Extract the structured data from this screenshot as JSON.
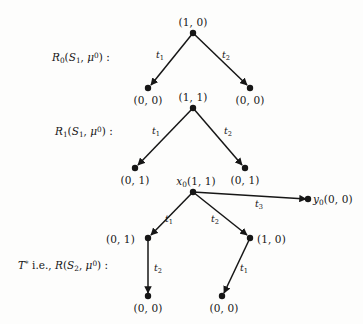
{
  "figure": {
    "background_color": "#fdfdfc",
    "ink_color": "#161616",
    "width": 363,
    "height": 324
  },
  "trees": [
    {
      "id": "tree-0",
      "row_label": {
        "name": "R",
        "name_sub": "0",
        "arg1": "S",
        "arg1_sub": "1",
        "arg2": "μ",
        "arg2_sup": "0",
        "colon": ":",
        "full_text": "R₀(S₁, μ⁰) :"
      },
      "root": {
        "id": "t0-root",
        "label": "(1, 0)",
        "x": 193,
        "y": 33
      },
      "children": [
        {
          "id": "t0-left",
          "label": "(0, 0)",
          "x": 148,
          "y": 88,
          "edge_label": "t",
          "edge_label_sub": "1"
        },
        {
          "id": "t0-right",
          "label": "(0, 0)",
          "x": 250,
          "y": 88,
          "edge_label": "t",
          "edge_label_sub": "2"
        }
      ]
    },
    {
      "id": "tree-1",
      "row_label": {
        "name": "R",
        "name_sub": "1",
        "arg1": "S",
        "arg1_sub": "1",
        "arg2": "μ",
        "arg2_sup": "0",
        "colon": ":",
        "full_text": "R₁(S₁, μ⁰) :"
      },
      "root": {
        "id": "t1-root",
        "label": "(1, 1)",
        "x": 193,
        "y": 108
      },
      "children": [
        {
          "id": "t1-left",
          "label": "(0, 1)",
          "x": 135,
          "y": 168,
          "edge_label": "t",
          "edge_label_sub": "1"
        },
        {
          "id": "t1-right",
          "label": "(0, 1)",
          "x": 245,
          "y": 168,
          "edge_label": "t",
          "edge_label_sub": "2"
        }
      ]
    },
    {
      "id": "tree-2",
      "row_label": {
        "name": "T",
        "name_sup": "*",
        "connector": "i.e.,",
        "name2": "R",
        "arg1": "S",
        "arg1_sub": "2",
        "arg2": "μ",
        "arg2_sup": "0",
        "colon": ":",
        "full_text": "T* i.e., R(S₂, μ⁰) :"
      },
      "root": {
        "id": "t2-root",
        "name": "x",
        "name_sub": "0",
        "label": "(1, 1)",
        "full_label": "x₀(1, 1)",
        "x": 193,
        "y": 192
      },
      "children": [
        {
          "id": "t2-left",
          "label": "(0, 1)",
          "x": 148,
          "y": 238,
          "edge_label": "t",
          "edge_label_sub": "1"
        },
        {
          "id": "t2-right",
          "label": "(1, 0)",
          "x": 250,
          "y": 238,
          "edge_label": "t",
          "edge_label_sub": "2"
        },
        {
          "id": "t2-far-right",
          "name": "y",
          "name_sub": "0",
          "label": "(0, 0)",
          "full_label": "y₀(0, 0)",
          "x": 310,
          "y": 199,
          "edge_label": "t",
          "edge_label_sub": "3"
        }
      ],
      "grandchildren": [
        {
          "id": "t2-left-leaf",
          "label": "(0, 0)",
          "x": 148,
          "y": 297,
          "edge_label": "t",
          "edge_label_sub": "2",
          "parent": "t2-left"
        },
        {
          "id": "t2-right-leaf",
          "label": "(0, 0)",
          "x": 221,
          "y": 297,
          "edge_label": "t",
          "edge_label_sub": "1",
          "parent": "t2-right"
        }
      ]
    }
  ],
  "labels": {
    "t0_root": "(1, 0)",
    "t0_left": "(0, 0)",
    "t0_right": "(0, 0)",
    "t1_root": "(1, 1)",
    "t1_left": "(0, 1)",
    "t1_right": "(0, 1)",
    "t2_root_prefix": "x",
    "t2_root_prefix_sub": "0",
    "t2_root_pair": "(1, 1)",
    "t2_left": "(0, 1)",
    "t2_right": "(1, 0)",
    "t2_far_prefix": "y",
    "t2_far_prefix_sub": "0",
    "t2_far_pair": "(0, 0)",
    "t2_left_leaf": "(0, 0)",
    "t2_right_leaf": "(0, 0)",
    "t1_name": "t",
    "t1_idx": "1",
    "t2_name": "t",
    "t2_idx": "2",
    "t3_name": "t",
    "t3_idx": "3",
    "R_letter": "R",
    "R0_idx": "0",
    "R1_idx": "1",
    "S_letter": "S",
    "S1_idx": "1",
    "S2_idx": "2",
    "mu_letter": "μ",
    "mu_sup": "0",
    "T_letter": "T",
    "T_sup": "*",
    "ie_text": "i.e.,",
    "colon": ":",
    "open_paren": "(",
    "close_paren": ")",
    "comma": ","
  }
}
